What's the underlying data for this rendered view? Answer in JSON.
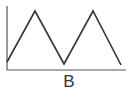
{
  "chart_data": {
    "type": "line",
    "title": "",
    "xlabel": "B",
    "ylabel": "",
    "x": [
      0,
      1,
      2,
      3,
      4
    ],
    "series": [
      {
        "name": "triangle-wave",
        "values": [
          0.1,
          1.0,
          0.05,
          1.0,
          0.05
        ]
      }
    ],
    "grid": false,
    "legend": null,
    "ticks": "none"
  },
  "diagram": {
    "label": "B",
    "stroke_color": "#333333",
    "background": "#ffffff",
    "points": [
      [
        7,
        62
      ],
      [
        35,
        11
      ],
      [
        64,
        64
      ],
      [
        93,
        11
      ],
      [
        121,
        65
      ]
    ],
    "axes": {
      "origin": [
        7,
        70
      ],
      "x_end": 126,
      "y_top": 6
    }
  }
}
